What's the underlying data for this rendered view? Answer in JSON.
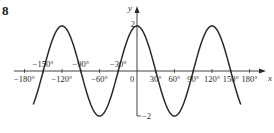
{
  "question_number": "8",
  "chart_data": {
    "type": "line",
    "title": "",
    "function": "y = 2cos(3x)",
    "amplitude": 2,
    "frequency": 3,
    "xlabel": "x",
    "ylabel": "y",
    "xlim": [
      -180,
      180
    ],
    "ylim": [
      -2,
      2
    ],
    "curve_domain": [
      -166,
      166
    ],
    "grid": false,
    "x_ticks_below": [
      {
        "value": -180,
        "label": "−180°"
      },
      {
        "value": -120,
        "label": "−120°"
      },
      {
        "value": -60,
        "label": "−60°"
      },
      {
        "value": 30,
        "label": "30°"
      },
      {
        "value": 60,
        "label": "60°"
      },
      {
        "value": 90,
        "label": "90°"
      },
      {
        "value": 120,
        "label": "120°"
      },
      {
        "value": 150,
        "label": "150°"
      },
      {
        "value": 180,
        "label": "180°"
      }
    ],
    "x_ticks_above": [
      {
        "value": -150,
        "label": "−150°"
      },
      {
        "value": -90,
        "label": "−90°"
      },
      {
        "value": -30,
        "label": "−30°"
      }
    ],
    "origin_label": "0",
    "y_labels": [
      {
        "value": 2,
        "label": "2"
      },
      {
        "value": -2,
        "label": "−2"
      }
    ],
    "series": [
      {
        "name": "2cos(3x)",
        "color": "#2a2a2a"
      }
    ]
  }
}
